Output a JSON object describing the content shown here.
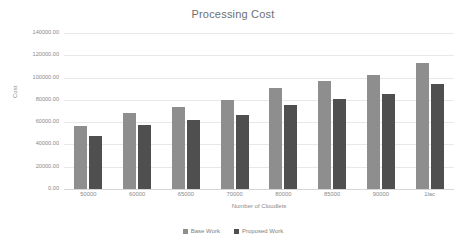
{
  "chart_data": {
    "type": "bar",
    "title": "Processing Cost",
    "xlabel": "Number of Cloudlets",
    "ylabel": "Cost",
    "categories": [
      "50000",
      "60000",
      "65000",
      "70000",
      "80000",
      "85000",
      "90000",
      "1lac"
    ],
    "series": [
      {
        "name": "Base Work",
        "color": "#8e8e8e",
        "values": [
          57000,
          68000,
          73500,
          80000,
          91000,
          96500,
          102500,
          113500
        ]
      },
      {
        "name": "Proposed Work",
        "color": "#4f4f4f",
        "values": [
          48000,
          57500,
          61500,
          66500,
          75500,
          80500,
          85000,
          94500
        ]
      }
    ],
    "ylim": [
      0,
      140000
    ],
    "ytick_values": [
      0,
      20000,
      40000,
      60000,
      80000,
      100000,
      120000,
      140000
    ],
    "ytick_labels": [
      "0.00",
      "20000.00",
      "40000.00",
      "60000.00",
      "80000.00",
      "100000.00",
      "120000.00",
      "140000.00"
    ],
    "grid": true,
    "legend_position": "bottom"
  }
}
